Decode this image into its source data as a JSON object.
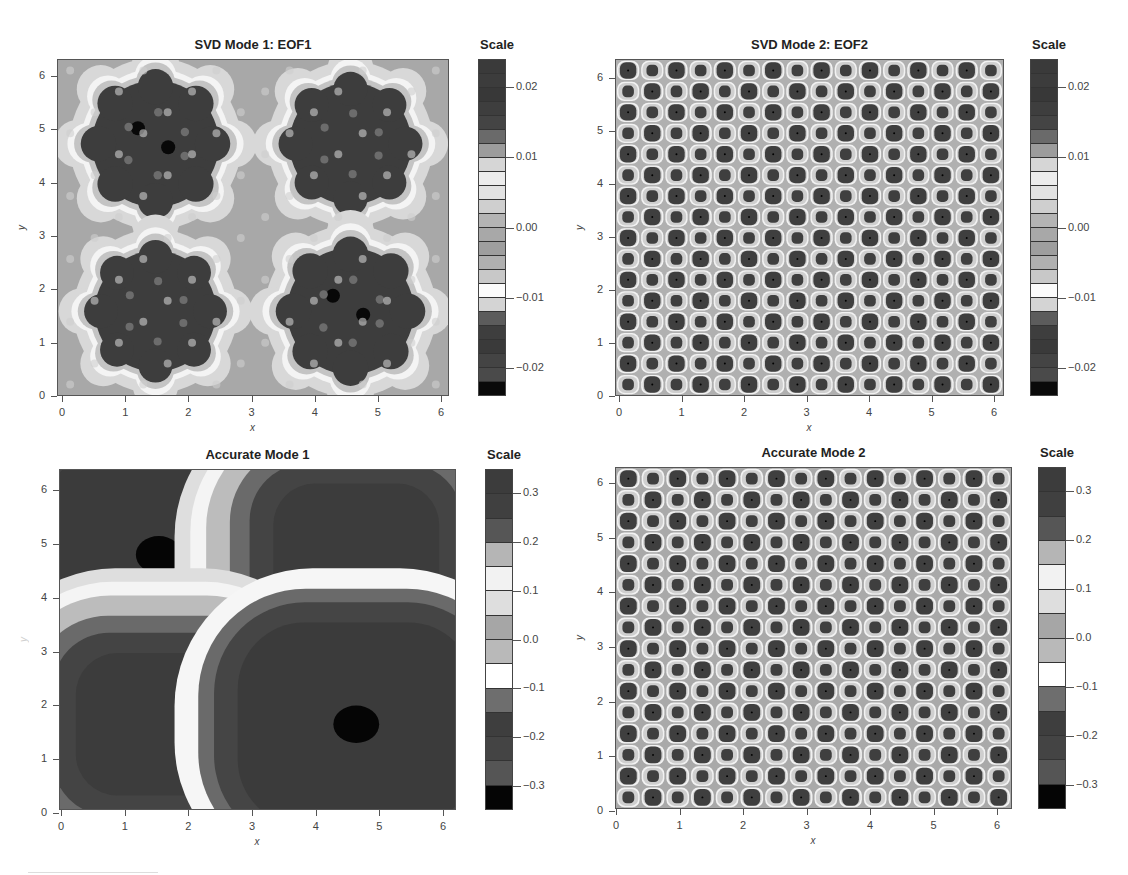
{
  "chart_data": [
    {
      "type": "heatmap",
      "title": "SVD Mode 1: EOF1",
      "xlabel": "x",
      "ylabel": "y",
      "xlim": [
        0,
        6.283
      ],
      "ylim": [
        0,
        6.283
      ],
      "xticks": [
        "0",
        "1",
        "2",
        "3",
        "4",
        "5",
        "6"
      ],
      "yticks": [
        "0",
        "1",
        "2",
        "3",
        "4",
        "5",
        "6"
      ],
      "colorbar": {
        "title": "Scale",
        "range": [
          -0.024,
          0.024
        ],
        "ticks": [
          "0.02",
          "0.01",
          "0.00",
          "−0.01",
          "−0.02"
        ],
        "tick_values": [
          0.02,
          0.01,
          0.0,
          -0.01,
          -0.02
        ],
        "bands": 24
      },
      "pattern": "four 8-lobed blobs centered near (1.57,4.71), (4.71,4.71), (1.57,1.57), (4.71,1.57); strongest at (1.57,4.71) and (4.71,1.57)",
      "grid": false
    },
    {
      "type": "heatmap",
      "title": "SVD Mode 2: EOF2",
      "xlabel": "x",
      "ylabel": "y",
      "xlim": [
        0,
        6.283
      ],
      "ylim": [
        0,
        6.283
      ],
      "xticks": [
        "0",
        "1",
        "2",
        "3",
        "4",
        "5",
        "6"
      ],
      "yticks": [
        "0",
        "1",
        "2",
        "3",
        "4",
        "5",
        "6"
      ],
      "colorbar": {
        "title": "Scale",
        "range": [
          -0.024,
          0.024
        ],
        "ticks": [
          "0.02",
          "0.01",
          "0.00",
          "−0.01",
          "−0.02"
        ],
        "tick_values": [
          0.02,
          0.01,
          0.0,
          -0.01,
          -0.02
        ],
        "bands": 24
      },
      "pattern": "16x16 lattice of alternating large/small dark spots",
      "grid_size": [
        16,
        16
      ],
      "grid": false
    },
    {
      "type": "heatmap",
      "title": "Accurate Mode 1",
      "xlabel": "x",
      "ylabel": "y",
      "xlim": [
        0,
        6.283
      ],
      "ylim": [
        0,
        6.283
      ],
      "xticks": [
        "0",
        "1",
        "2",
        "3",
        "4",
        "5",
        "6"
      ],
      "yticks": [
        "0",
        "1",
        "2",
        "3",
        "4",
        "5",
        "6"
      ],
      "colorbar": {
        "title": "Scale",
        "range": [
          -0.35,
          0.35
        ],
        "ticks": [
          "0.3",
          "0.2",
          "0.1",
          "0.0",
          "−0.1",
          "−0.2",
          "−0.3"
        ],
        "tick_values": [
          0.3,
          0.2,
          0.1,
          0.0,
          -0.1,
          -0.2,
          -0.3
        ],
        "bands": 14
      },
      "pattern": "sin(x)*sin(y)-like: four rounded-square wells centered at (1.57,4.71), (4.71,4.71), (1.57,1.57), (4.71,1.57); black cores at (1.57,4.71) and (4.71,1.57)",
      "grid": false
    },
    {
      "type": "heatmap",
      "title": "Accurate Mode 2",
      "xlabel": "x",
      "ylabel": "y",
      "xlim": [
        0,
        6.283
      ],
      "ylim": [
        0,
        6.283
      ],
      "xticks": [
        "0",
        "1",
        "2",
        "3",
        "4",
        "5",
        "6"
      ],
      "yticks": [
        "0",
        "1",
        "2",
        "3",
        "4",
        "5",
        "6"
      ],
      "colorbar": {
        "title": "Scale",
        "range": [
          -0.35,
          0.35
        ],
        "ticks": [
          "0.3",
          "0.2",
          "0.1",
          "0.0",
          "−0.1",
          "−0.2",
          "−0.3"
        ],
        "tick_values": [
          0.3,
          0.2,
          0.1,
          0.0,
          -0.1,
          -0.2,
          -0.3
        ],
        "bands": 14
      },
      "pattern": "16x16 lattice of alternating large/small dark spots",
      "grid_size": [
        16,
        16
      ],
      "grid": false
    }
  ],
  "panels": [
    {
      "title": "SVD Mode 1: EOF1",
      "scale_title": "Scale",
      "xlabel": "x",
      "ylabel": "y",
      "ticks": [
        "0",
        "1",
        "2",
        "3",
        "4",
        "5",
        "6"
      ],
      "cbar_labels": [
        "0.02",
        "0.01",
        "0.00",
        "−0.01",
        "−0.02"
      ]
    },
    {
      "title": "SVD Mode 2: EOF2",
      "scale_title": "Scale",
      "xlabel": "x",
      "ylabel": "y",
      "ticks": [
        "0",
        "1",
        "2",
        "3",
        "4",
        "5",
        "6"
      ],
      "cbar_labels": [
        "0.02",
        "0.01",
        "0.00",
        "−0.01",
        "−0.02"
      ]
    },
    {
      "title": "Accurate Mode 1",
      "scale_title": "Scale",
      "xlabel": "x",
      "ylabel": "y",
      "ticks": [
        "0",
        "1",
        "2",
        "3",
        "4",
        "5",
        "6"
      ],
      "cbar_labels": [
        "0.3",
        "0.2",
        "0.1",
        "0.0",
        "−0.1",
        "−0.2",
        "−0.3"
      ]
    },
    {
      "title": "Accurate Mode 2",
      "scale_title": "Scale",
      "xlabel": "x",
      "ylabel": "y",
      "ticks": [
        "0",
        "1",
        "2",
        "3",
        "4",
        "5",
        "6"
      ],
      "cbar_labels": [
        "0.3",
        "0.2",
        "0.1",
        "0.0",
        "−0.1",
        "−0.2",
        "−0.3"
      ]
    }
  ],
  "colors": {
    "eof_bands": [
      "#3a3a3a",
      "#3c3c3c",
      "#383838",
      "#3e3e3e",
      "#444444",
      "#6a6a6a",
      "#9c9c9c",
      "#d6d6d6",
      "#ececec",
      "#e2e2e2",
      "#cfcfcf",
      "#b4b4b4",
      "#a8a8a8",
      "#9e9e9e",
      "#b0b0b0",
      "#c8c8c8",
      "#fbfbfb",
      "#d4d4d4",
      "#5c5c5c",
      "#3e3e3e",
      "#3a3a3a",
      "#444444",
      "#4a4a4a",
      "#0a0a0a"
    ],
    "accurate_bands": [
      "#3c3c3c",
      "#404040",
      "#565656",
      "#b5b5b5",
      "#f2f2f2",
      "#dedede",
      "#a6a6a6",
      "#b9b9b9",
      "#ffffff",
      "#6e6e6e",
      "#3e3e3e",
      "#444444",
      "#555555",
      "#050505"
    ]
  }
}
